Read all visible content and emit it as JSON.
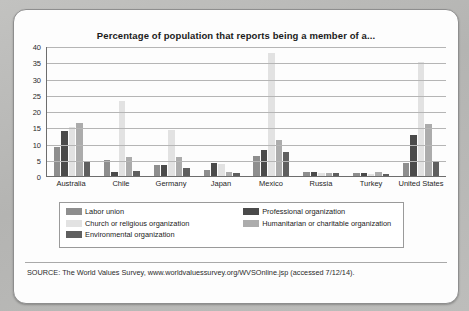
{
  "card": {
    "title": "Percentage of population that reports being a member of a...",
    "source": "SOURCE: The World Values Survey, www.worldvaluessurvey.org/WVSOnline.jsp (accessed 7/12/14)."
  },
  "legend": {
    "column_one": [
      {
        "label": "Labor union",
        "color": "#8e8e8e"
      },
      {
        "label": "Church or religious organization",
        "color": "#e2e2e2"
      },
      {
        "label": "Environmental organization",
        "color": "#5f5f5f"
      }
    ],
    "column_two": [
      {
        "label": "Professional organization",
        "color": "#4a4a4a"
      },
      {
        "label": "Humanitarian or charitable organization",
        "color": "#acacac"
      }
    ]
  },
  "chart_data": {
    "type": "bar",
    "title": "Percentage of population that reports being a member of a...",
    "xlabel": "",
    "ylabel": "",
    "ylim": [
      0,
      40
    ],
    "yticks": [
      0,
      5,
      10,
      15,
      20,
      25,
      30,
      35,
      40
    ],
    "grid": true,
    "legend_position": "bottom",
    "categories": [
      "Australia",
      "Chile",
      "Germany",
      "Japan",
      "Mexico",
      "Russia",
      "Turkey",
      "United States"
    ],
    "series": [
      {
        "name": "Labor union",
        "color": "#8e8e8e",
        "values": [
          9.0,
          5.0,
          3.5,
          2.0,
          6.3,
          1.2,
          1.0,
          4.0
        ]
      },
      {
        "name": "Professional organization",
        "color": "#4a4a4a",
        "values": [
          13.7,
          1.2,
          3.5,
          4.0,
          8.0,
          1.3,
          0.9,
          12.5
        ]
      },
      {
        "name": "Church or religious organization",
        "color": "#e2e2e2",
        "values": [
          15.0,
          23.0,
          14.2,
          3.7,
          38.0,
          1.0,
          0.6,
          35.0
        ]
      },
      {
        "name": "Humanitarian or charitable organization",
        "color": "#acacac",
        "values": [
          16.2,
          5.8,
          5.7,
          1.2,
          11.0,
          1.0,
          1.1,
          16.0
        ]
      },
      {
        "name": "Environmental organization",
        "color": "#5f5f5f",
        "values": [
          4.3,
          1.5,
          2.5,
          1.0,
          7.3,
          0.9,
          0.7,
          4.6
        ]
      }
    ]
  }
}
